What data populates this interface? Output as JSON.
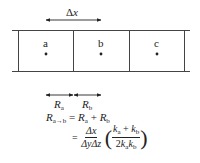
{
  "diagram": {
    "cells": [
      {
        "label": "a"
      },
      {
        "label": "b"
      },
      {
        "label": "c"
      }
    ],
    "spacing_label": {
      "delta": "Δ",
      "var": "x"
    },
    "resistances": [
      {
        "symbol": "R",
        "sub": "a"
      },
      {
        "symbol": "R",
        "sub": "b"
      }
    ],
    "equation": {
      "line1": {
        "lhs_symbol": "R",
        "lhs_sub": "a→b",
        "equals": "=",
        "term1_symbol": "R",
        "term1_sub": "a",
        "plus": "+",
        "term2_symbol": "R",
        "term2_sub": "b"
      },
      "line2": {
        "equals": "=",
        "frac1_num": "Δx",
        "frac1_den": "ΔyΔz",
        "frac2_num_k1": "k",
        "frac2_num_k1_sub": "a",
        "frac2_num_plus": "+",
        "frac2_num_k2": "k",
        "frac2_num_k2_sub": "b",
        "frac2_den_coef": "2",
        "frac2_den_k1": "k",
        "frac2_den_k1_sub": "a",
        "frac2_den_k2": "k",
        "frac2_den_k2_sub": "b",
        "lparen": "(",
        "rparen": ")"
      }
    },
    "colors": {
      "line": "#333333",
      "background": "#ffffff"
    }
  }
}
